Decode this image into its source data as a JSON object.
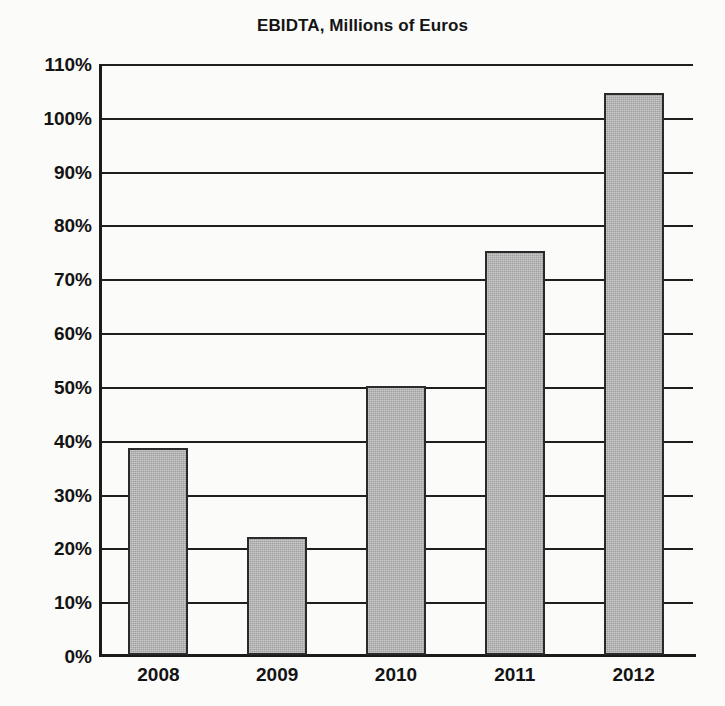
{
  "chart_data": {
    "type": "bar",
    "title": "EBIDTA, Millions of Euros",
    "xlabel": "",
    "ylabel": "",
    "categories": [
      "2008",
      "2009",
      "2010",
      "2011",
      "2012"
    ],
    "values": [
      38.5,
      22,
      50,
      75,
      104.5
    ],
    "value_labels": [
      "38.5%",
      "22%",
      "50%",
      "75%",
      "104.5%"
    ],
    "ylim": [
      0,
      110
    ],
    "ytick_values": [
      0,
      10,
      20,
      30,
      40,
      50,
      60,
      70,
      80,
      90,
      100,
      110
    ],
    "ytick_labels": [
      "0%",
      "10%",
      "20%",
      "30%",
      "40%",
      "50%",
      "60%",
      "70%",
      "80%",
      "90%",
      "100%",
      "110%"
    ],
    "grid": true,
    "grid_axis": "y",
    "legend": false,
    "legend_position": "none",
    "series": [
      {
        "name": "EBIDTA",
        "values": [
          38.5,
          22,
          50,
          75,
          104.5
        ]
      }
    ],
    "colors": {
      "bar_fill": "#b3b3b3",
      "bar_border": "#2a2a2a",
      "axis": "#1b1b1b",
      "gridline": "#1e1e1e",
      "text": "#131313",
      "background": "#fbfbfa"
    }
  }
}
